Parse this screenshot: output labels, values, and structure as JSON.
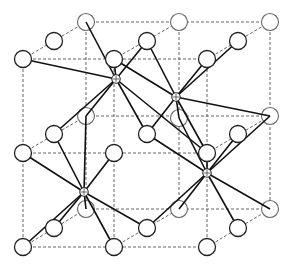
{
  "diagram": {
    "type": "crystal-structure",
    "colors": {
      "line": "#222222",
      "dashed_edge": "#555555",
      "background": "#ffffff"
    },
    "cube_edges": [
      [
        86,
        22,
        270,
        22
      ],
      [
        86,
        22,
        86,
        209
      ],
      [
        270,
        22,
        270,
        209
      ],
      [
        86,
        209,
        270,
        209
      ],
      [
        23,
        59,
        207,
        59
      ],
      [
        23,
        59,
        23,
        247
      ],
      [
        207,
        59,
        207,
        247
      ],
      [
        23,
        247,
        207,
        247
      ],
      [
        23,
        59,
        86,
        22
      ],
      [
        207,
        59,
        270,
        22
      ],
      [
        23,
        247,
        86,
        209
      ],
      [
        207,
        247,
        270,
        209
      ],
      [
        23,
        153,
        86,
        116
      ],
      [
        207,
        153,
        270,
        116
      ],
      [
        114,
        59,
        179,
        22
      ],
      [
        114,
        247,
        179,
        209
      ],
      [
        86,
        116,
        270,
        116
      ],
      [
        179,
        22,
        179,
        209
      ],
      [
        23,
        153,
        207,
        153
      ],
      [
        114,
        59,
        114,
        247
      ]
    ],
    "anions": [
      {
        "x": 86,
        "y": 22,
        "back": true
      },
      {
        "x": 179,
        "y": 22,
        "back": true
      },
      {
        "x": 270,
        "y": 22,
        "back": true
      },
      {
        "x": 54,
        "y": 41
      },
      {
        "x": 147,
        "y": 41
      },
      {
        "x": 238,
        "y": 41
      },
      {
        "x": 23,
        "y": 59
      },
      {
        "x": 114,
        "y": 59
      },
      {
        "x": 207,
        "y": 59
      },
      {
        "x": 86,
        "y": 116,
        "back": true
      },
      {
        "x": 179,
        "y": 118,
        "back": true
      },
      {
        "x": 270,
        "y": 116,
        "back": true
      },
      {
        "x": 54,
        "y": 134
      },
      {
        "x": 147,
        "y": 134
      },
      {
        "x": 238,
        "y": 134
      },
      {
        "x": 23,
        "y": 153
      },
      {
        "x": 114,
        "y": 153
      },
      {
        "x": 207,
        "y": 153
      },
      {
        "x": 86,
        "y": 209,
        "back": true
      },
      {
        "x": 179,
        "y": 209,
        "back": true
      },
      {
        "x": 270,
        "y": 209,
        "back": true
      },
      {
        "x": 54,
        "y": 228
      },
      {
        "x": 147,
        "y": 228
      },
      {
        "x": 238,
        "y": 228
      },
      {
        "x": 23,
        "y": 247
      },
      {
        "x": 114,
        "y": 247
      },
      {
        "x": 207,
        "y": 247
      }
    ],
    "cations": [
      {
        "x": 116,
        "y": 79,
        "bonds": [
          [
            23,
            59
          ],
          [
            114,
            59
          ],
          [
            86,
            22
          ],
          [
            147,
            41
          ],
          [
            54,
            134
          ],
          [
            86,
            116
          ],
          [
            147,
            134
          ],
          [
            207,
            153
          ]
        ]
      },
      {
        "x": 176,
        "y": 97,
        "bonds": [
          [
            114,
            59
          ],
          [
            147,
            41
          ],
          [
            238,
            41
          ],
          [
            207,
            59
          ],
          [
            179,
            118
          ],
          [
            147,
            134
          ],
          [
            207,
            153
          ],
          [
            270,
            116
          ]
        ]
      },
      {
        "x": 84,
        "y": 192,
        "bonds": [
          [
            23,
            153
          ],
          [
            114,
            153
          ],
          [
            54,
            134
          ],
          [
            86,
            116
          ],
          [
            23,
            247
          ],
          [
            54,
            228
          ],
          [
            114,
            247
          ],
          [
            147,
            228
          ],
          [
            86,
            209
          ]
        ]
      },
      {
        "x": 207,
        "y": 173,
        "bonds": [
          [
            147,
            134
          ],
          [
            238,
            134
          ],
          [
            207,
            153
          ],
          [
            179,
            118
          ],
          [
            147,
            228
          ],
          [
            238,
            228
          ],
          [
            270,
            209
          ],
          [
            179,
            209
          ],
          [
            270,
            116
          ]
        ]
      }
    ]
  }
}
